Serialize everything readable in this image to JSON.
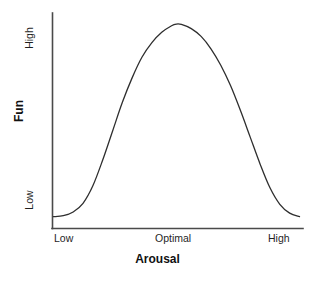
{
  "chart_data": {
    "type": "line",
    "title": "",
    "subtitle": "",
    "xlabel": "Arousal",
    "ylabel": "Fun",
    "x_tick_labels": [
      "Low",
      "Optimal",
      "High"
    ],
    "y_tick_labels": [
      "Low",
      "High"
    ],
    "x_tick_positions": [
      0,
      0.5,
      1
    ],
    "y_tick_positions": [
      0.06,
      0.94
    ],
    "xlim": [
      0,
      1
    ],
    "ylim": [
      0,
      1
    ],
    "grid": false,
    "legend": false,
    "legend_position": "none",
    "annotations": [],
    "series": [
      {
        "name": "Fun vs Arousal",
        "shape": "inverted-U",
        "color": "#2e2e2e",
        "line_width": 1.3,
        "x": [
          0.0,
          0.04,
          0.08,
          0.12,
          0.16,
          0.2,
          0.24,
          0.28,
          0.32,
          0.36,
          0.4,
          0.44,
          0.48,
          0.5,
          0.52,
          0.56,
          0.6,
          0.64,
          0.68,
          0.72,
          0.76,
          0.8,
          0.84,
          0.88,
          0.92,
          0.96,
          1.0
        ],
        "y": [
          0.055,
          0.06,
          0.078,
          0.12,
          0.205,
          0.33,
          0.47,
          0.61,
          0.73,
          0.83,
          0.9,
          0.95,
          0.982,
          0.99,
          0.988,
          0.968,
          0.93,
          0.87,
          0.79,
          0.69,
          0.57,
          0.44,
          0.31,
          0.195,
          0.115,
          0.072,
          0.055
        ]
      }
    ]
  },
  "axes": {
    "y_axis_line_color": "#4a4a4a",
    "x_axis_line_color": "#4a4a4a",
    "axis_line_width": 1.4,
    "background_color": "#ffffff"
  }
}
